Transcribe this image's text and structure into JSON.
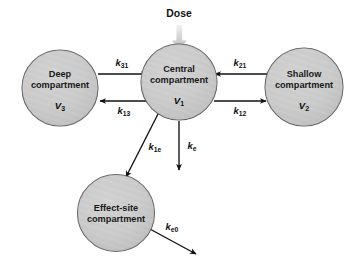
{
  "diagram": {
    "background_color": "#ffffff",
    "node_fill_color": "#c9c9c9",
    "node_stroke_color": "#555555",
    "arrow_color": "#111111",
    "dose_arrow_color": "#c0c0c0"
  },
  "dose": {
    "label": "Dose"
  },
  "compartments": {
    "deep": {
      "line1": "Deep",
      "line2": "compartment",
      "volume_symbol": "V",
      "volume_subscript": "3"
    },
    "central": {
      "line1": "Central",
      "line2": "compartment",
      "volume_symbol": "V",
      "volume_subscript": "1"
    },
    "shallow": {
      "line1": "Shallow",
      "line2": "compartment",
      "volume_symbol": "V",
      "volume_subscript": "2"
    },
    "effect_site": {
      "line1": "Effect-site",
      "line2": "compartment",
      "volume_symbol": "",
      "volume_subscript": ""
    }
  },
  "rate_constants": {
    "k31": {
      "symbol": "k",
      "subscript": "31"
    },
    "k13": {
      "symbol": "k",
      "subscript": "13"
    },
    "k21": {
      "symbol": "k",
      "subscript": "21"
    },
    "k12": {
      "symbol": "k",
      "subscript": "12"
    },
    "k1e": {
      "symbol": "k",
      "subscript": "1e"
    },
    "ke": {
      "symbol": "k",
      "subscript": "e"
    },
    "ke0": {
      "symbol": "k",
      "subscript": "e0"
    }
  }
}
